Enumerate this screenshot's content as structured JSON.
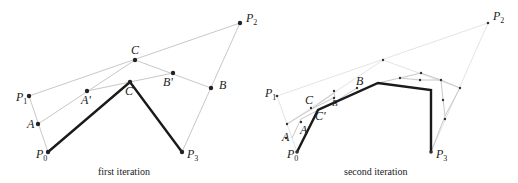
{
  "panels": [
    {
      "caption": "first iteration",
      "labels": {
        "P0": "P",
        "P0_sub": "0",
        "P1": "P",
        "P1_sub": "1",
        "P2": "P",
        "P2_sub": "2",
        "P3": "P",
        "P3_sub": "3",
        "A": "A",
        "B": "B",
        "C": "C",
        "A_prime": "A'",
        "B_prime": "B'",
        "C_prime": "C'"
      },
      "points": {
        "P0": [
          48,
          152
        ],
        "P1": [
          29,
          96
        ],
        "P2": [
          240,
          23
        ],
        "P3": [
          182,
          152
        ],
        "A": [
          38,
          124
        ],
        "C": [
          135,
          60
        ],
        "B": [
          211,
          88
        ],
        "A_prime": [
          87,
          91
        ],
        "B_prime": [
          173,
          73
        ],
        "C_prime": [
          130,
          82
        ]
      }
    },
    {
      "caption": "second iteration",
      "labels": {
        "P0": "P",
        "P0_sub": "0",
        "P1": "P",
        "P1_sub": "1",
        "P2": "P",
        "P2_sub": "2",
        "P3": "P",
        "P3_sub": "3",
        "A": "A",
        "B": "B",
        "C": "C",
        "A_prime": "A'",
        "B_prime": "B'",
        "C_prime": "C'"
      },
      "points": {
        "P0": [
          297,
          152
        ],
        "P1": [
          277,
          96
        ],
        "P2": [
          488,
          23
        ],
        "P3": [
          431,
          152
        ]
      }
    }
  ],
  "colors": {
    "construction_line": "#c8c8c8",
    "result_polyline": "#1a1a1a",
    "point": "#222222"
  }
}
